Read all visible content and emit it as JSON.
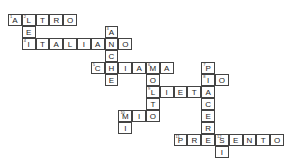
{
  "puzzle": {
    "type": "crossword",
    "cell_w": 13.8,
    "cell_h": 12,
    "origin_x": 8,
    "origin_y": 14,
    "words": [
      {
        "number": "1",
        "answer": "ALTRO",
        "row": 0,
        "col": 0,
        "dir": "across"
      },
      {
        "number": "2",
        "answer": "LEI",
        "row": 0,
        "col": 1,
        "dir": "down"
      },
      {
        "number": "3",
        "answer": "ANCHE",
        "row": 1,
        "col": 7,
        "dir": "down"
      },
      {
        "number": "4",
        "answer": "ITALIANO",
        "row": 2,
        "col": 1,
        "dir": "across"
      },
      {
        "number": "5",
        "answer": "CHIAMA",
        "row": 4,
        "col": 6,
        "dir": "across"
      },
      {
        "number": "6",
        "answer": "MOLTO",
        "row": 4,
        "col": 10,
        "dir": "down"
      },
      {
        "number": "7",
        "answer": "PIACERE",
        "row": 4,
        "col": 14,
        "dir": "down"
      },
      {
        "number": "8",
        "answer": "IO",
        "row": 5,
        "col": 14,
        "dir": "across"
      },
      {
        "number": "9",
        "answer": "LIETA",
        "row": 6,
        "col": 10,
        "dir": "across"
      },
      {
        "number": "10",
        "answer": "MIO",
        "row": 8,
        "col": 8,
        "dir": "across"
      },
      {
        "number": "10",
        "answer": "MI",
        "row": 8,
        "col": 8,
        "dir": "down"
      },
      {
        "number": "11",
        "answer": "PRESENTO",
        "row": 10,
        "col": 12,
        "dir": "across"
      },
      {
        "number": "12",
        "answer": "SI",
        "row": 10,
        "col": 15,
        "dir": "down"
      }
    ]
  }
}
